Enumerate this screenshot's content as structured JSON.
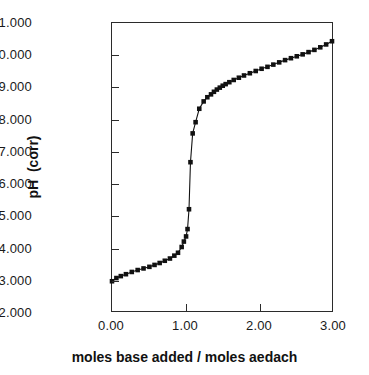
{
  "chart_data": {
    "type": "line",
    "title": "",
    "subtitle": "",
    "xlabel": "moles base added / moles aedach",
    "ylabel": "pH  (corr)",
    "xlim": [
      0.0,
      3.0
    ],
    "ylim": [
      2.0,
      11.0
    ],
    "xticks": [
      0.0,
      1.0,
      2.0,
      3.0
    ],
    "xticklabels": [
      "0.00",
      "1.00",
      "2.00",
      "3.00"
    ],
    "yticks": [
      2.0,
      3.0,
      4.0,
      5.0,
      6.0,
      7.0,
      8.0,
      9.0,
      10.0,
      11.0
    ],
    "yticklabels": [
      "2.000",
      "3.000",
      "4.000",
      "5.000",
      "6.000",
      "7.000",
      "8.000",
      "9.000",
      "10.000",
      "11.000"
    ],
    "grid": false,
    "legend": false,
    "legend_position": "none",
    "marker": "square",
    "marker_color": "#111111",
    "line_color": "#111111",
    "series": [
      {
        "name": "titration curve",
        "x": [
          0.0,
          0.06,
          0.12,
          0.19,
          0.27,
          0.35,
          0.43,
          0.51,
          0.58,
          0.65,
          0.72,
          0.79,
          0.85,
          0.9,
          0.95,
          0.98,
          1.01,
          1.03,
          1.05,
          1.07,
          1.1,
          1.14,
          1.19,
          1.25,
          1.3,
          1.35,
          1.39,
          1.43,
          1.47,
          1.51,
          1.55,
          1.6,
          1.66,
          1.73,
          1.8,
          1.88,
          1.96,
          2.04,
          2.12,
          2.2,
          2.28,
          2.36,
          2.44,
          2.52,
          2.6,
          2.68,
          2.76,
          2.84,
          2.92,
          3.0
        ],
        "y": [
          2.93,
          3.03,
          3.09,
          3.15,
          3.22,
          3.28,
          3.33,
          3.38,
          3.44,
          3.5,
          3.57,
          3.64,
          3.73,
          3.82,
          4.0,
          4.17,
          4.33,
          4.56,
          5.18,
          6.65,
          7.55,
          7.9,
          8.32,
          8.55,
          8.68,
          8.77,
          8.85,
          8.92,
          8.98,
          9.04,
          9.09,
          9.15,
          9.22,
          9.29,
          9.36,
          9.43,
          9.5,
          9.57,
          9.63,
          9.7,
          9.77,
          9.84,
          9.9,
          9.96,
          10.02,
          10.09,
          10.16,
          10.24,
          10.33,
          10.43
        ]
      }
    ]
  }
}
